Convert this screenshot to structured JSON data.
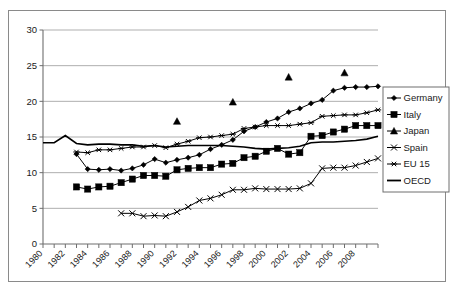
{
  "top_partial_text": "",
  "chart_data": {
    "type": "line",
    "title": "",
    "subtitle": "",
    "xlabel": "",
    "ylabel": "",
    "xlim": [
      1980,
      2010
    ],
    "ylim": [
      0,
      30
    ],
    "ytick_step": 5,
    "yticks": [
      "0",
      "5",
      "10",
      "15",
      "20",
      "25",
      "30"
    ],
    "xticks": [
      "1980",
      "1982",
      "1984",
      "1986",
      "1988",
      "1990",
      "1992",
      "1994",
      "1996",
      "1998",
      "2000",
      "2002",
      "2004",
      "2006",
      "2008"
    ],
    "xtick_step": 2,
    "grid": "horizontal",
    "legend_position": "right",
    "plot_bgcolor": "#ffffff",
    "line_color": "#000000",
    "grid_color": "#a6a6a6",
    "axis_color": "#6e6e6e",
    "x": [
      1980,
      1981,
      1982,
      1983,
      1984,
      1985,
      1986,
      1987,
      1988,
      1989,
      1990,
      1991,
      1992,
      1993,
      1994,
      1995,
      1996,
      1997,
      1998,
      1999,
      2000,
      2001,
      2002,
      2003,
      2004,
      2005,
      2006,
      2007,
      2008,
      2009,
      2010
    ],
    "series": [
      {
        "name": "Germany",
        "marker": "diamond",
        "values": [
          null,
          null,
          null,
          12.6,
          10.5,
          10.4,
          10.5,
          10.3,
          10.6,
          11.1,
          11.9,
          11.4,
          11.8,
          12.1,
          12.5,
          13.3,
          13.9,
          14.6,
          15.8,
          16.4,
          17.1,
          17.6,
          18.5,
          19.0,
          19.7,
          20.2,
          21.5,
          21.9,
          22.0,
          22.0,
          22.1
        ]
      },
      {
        "name": "Italy",
        "marker": "square",
        "values": [
          null,
          null,
          null,
          8.0,
          7.7,
          8.0,
          8.1,
          8.6,
          9.1,
          9.6,
          9.6,
          9.5,
          10.4,
          10.6,
          10.7,
          10.7,
          11.2,
          11.3,
          12.1,
          12.3,
          13.0,
          13.4,
          12.6,
          12.8,
          15.1,
          15.2,
          15.7,
          16.1,
          16.6,
          16.6,
          16.6
        ]
      },
      {
        "name": "Japan",
        "marker": "triangle",
        "values": [
          null,
          null,
          null,
          null,
          null,
          null,
          null,
          null,
          null,
          null,
          null,
          null,
          17.2,
          null,
          null,
          null,
          null,
          19.9,
          null,
          null,
          null,
          null,
          23.4,
          null,
          null,
          null,
          null,
          24.0,
          null,
          null,
          null
        ]
      },
      {
        "name": "Spain",
        "marker": "cross",
        "values": [
          null,
          null,
          null,
          null,
          null,
          null,
          null,
          4.3,
          4.3,
          3.9,
          4.0,
          3.9,
          4.5,
          5.2,
          6.1,
          6.4,
          6.9,
          7.6,
          7.6,
          7.8,
          7.7,
          7.7,
          7.7,
          7.8,
          8.5,
          10.6,
          10.7,
          10.7,
          11.0,
          11.5,
          12.0
        ]
      },
      {
        "name": "EU 15",
        "marker": "star",
        "values": [
          null,
          null,
          null,
          12.9,
          12.8,
          13.2,
          13.2,
          13.4,
          13.6,
          13.6,
          13.8,
          13.5,
          14.0,
          14.4,
          14.9,
          15.0,
          15.2,
          15.4,
          16.2,
          16.4,
          16.6,
          16.6,
          16.6,
          16.8,
          17.0,
          17.9,
          18.0,
          18.1,
          18.1,
          18.4,
          18.8
        ]
      },
      {
        "name": "OECD",
        "marker": "none",
        "values": [
          14.2,
          14.2,
          15.2,
          14.1,
          13.9,
          14.0,
          14.0,
          13.9,
          13.9,
          13.7,
          13.8,
          13.6,
          13.7,
          13.8,
          13.8,
          13.8,
          13.8,
          13.7,
          13.6,
          13.4,
          13.3,
          13.4,
          13.5,
          13.7,
          14.2,
          14.3,
          14.3,
          14.4,
          14.5,
          14.7,
          15.1
        ]
      }
    ]
  },
  "legend": {
    "items": [
      {
        "label": "Germany",
        "marker": "diamond"
      },
      {
        "label": "Italy",
        "marker": "square"
      },
      {
        "label": "Japan",
        "marker": "triangle"
      },
      {
        "label": "Spain",
        "marker": "cross"
      },
      {
        "label": "EU 15",
        "marker": "star"
      },
      {
        "label": "OECD",
        "marker": "none"
      }
    ]
  }
}
